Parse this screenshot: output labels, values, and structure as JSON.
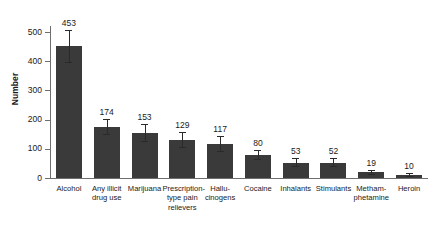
{
  "chart_data": {
    "type": "bar",
    "title": "",
    "subtitle": "",
    "xlabel": "",
    "ylabel": "Number",
    "ylim": [
      0,
      500
    ],
    "yticks": [
      0,
      100,
      200,
      300,
      400,
      500
    ],
    "ytick_labels": [
      "0",
      "100",
      "200",
      "300",
      "400",
      "500"
    ],
    "grid": false,
    "legend": null,
    "bar_color": "#3a3a3a",
    "axis_color": "#6e6e6e",
    "error_bars": true,
    "categories": [
      "Alcohol",
      "Any illicit drug use",
      "Marijuana",
      "Prescription-type pain relievers",
      "Hallucinogens",
      "Cocaine",
      "Inhalants",
      "Stimulants",
      "Methamphetamine",
      "Heroin"
    ],
    "category_label_lines": [
      [
        "Alcohol"
      ],
      [
        "Any illicit",
        "drug use"
      ],
      [
        "Marijuana"
      ],
      [
        "Prescription-",
        "type pain",
        "relievers"
      ],
      [
        "Hallu-",
        "cinogens"
      ],
      [
        "Cocaine"
      ],
      [
        "Inhalants"
      ],
      [
        "Stimulants"
      ],
      [
        "Metham-",
        "phetamine"
      ],
      [
        "Heroin"
      ]
    ],
    "values": [
      453,
      174,
      153,
      129,
      117,
      80,
      53,
      52,
      19,
      10
    ],
    "value_labels": [
      "453",
      "174",
      "153",
      "129",
      "117",
      "80",
      "53",
      "52",
      "19",
      "10"
    ],
    "error_low": [
      398,
      150,
      128,
      105,
      92,
      64,
      41,
      40,
      13,
      6
    ],
    "error_high": [
      508,
      203,
      185,
      156,
      143,
      97,
      68,
      67,
      27,
      16
    ]
  },
  "axis": {
    "y_title": "Number"
  }
}
